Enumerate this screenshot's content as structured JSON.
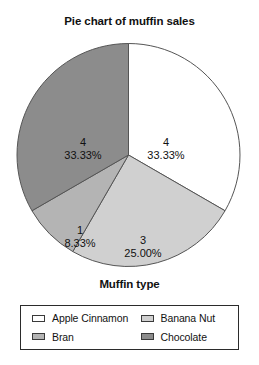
{
  "chart_data": {
    "type": "pie",
    "title": "Pie chart of muffin sales",
    "xlabel": "Muffin type",
    "ylabel": "",
    "legend_position": "bottom",
    "grid": false,
    "start_angle_deg": 90,
    "direction": "clockwise",
    "categories": [
      "Apple Cinnamon",
      "Banana Nut",
      "Bran",
      "Chocolate"
    ],
    "values": [
      4,
      3,
      1,
      4
    ],
    "percentages": [
      "33.33%",
      "25.00%",
      "8.33%",
      "33.33%"
    ],
    "total": 12,
    "colors": [
      "#ffffff",
      "#d0d0d0",
      "#b4b4b4",
      "#8c8c8c"
    ],
    "slices": [
      {
        "label": "Apple Cinnamon",
        "value": 4,
        "value_text": "4",
        "percent": 33.33,
        "percent_text": "33.33%",
        "color": "#ffffff",
        "angle_deg": 120,
        "start_deg": 0,
        "end_deg": 120,
        "label_x": 166,
        "label_y": 110
      },
      {
        "label": "Banana Nut",
        "value": 3,
        "value_text": "3",
        "percent": 25.0,
        "percent_text": "25.00%",
        "color": "#d0d0d0",
        "angle_deg": 90,
        "start_deg": 120,
        "end_deg": 210,
        "label_x": 143,
        "label_y": 208
      },
      {
        "label": "Bran",
        "value": 1,
        "value_text": "1",
        "percent": 8.33,
        "percent_text": "8.33%",
        "color": "#b4b4b4",
        "angle_deg": 30,
        "start_deg": 210,
        "end_deg": 240,
        "label_x": 80,
        "label_y": 198
      },
      {
        "label": "Chocolate",
        "value": 4,
        "value_text": "4",
        "percent": 33.33,
        "percent_text": "33.33%",
        "color": "#8c8c8c",
        "angle_deg": 120,
        "start_deg": 240,
        "end_deg": 360,
        "label_x": 83,
        "label_y": 110
      }
    ]
  },
  "chart": {
    "title": "Pie chart of muffin sales",
    "axis_label": "Muffin type"
  },
  "legend": {
    "entries": [
      {
        "label": "Apple Cinnamon",
        "color": "#ffffff"
      },
      {
        "label": "Banana Nut",
        "color": "#d0d0d0"
      },
      {
        "label": "Bran",
        "color": "#b4b4b4"
      },
      {
        "label": "Chocolate",
        "color": "#8c8c8c"
      }
    ]
  }
}
